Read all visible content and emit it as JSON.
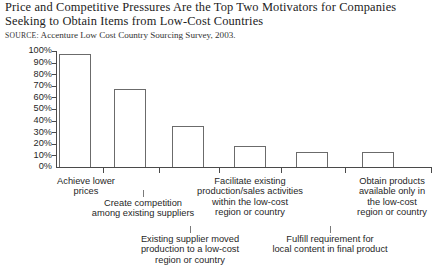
{
  "title": {
    "line1": "Price and Competitive Pressures Are the Top Two Motivators for Companies",
    "line2": "Seeking to Obtain Items from Low-Cost Countries"
  },
  "source": {
    "label": "SOURCE:",
    "text": "Accenture Low Cost Country Sourcing Survey, 2003."
  },
  "colors": {
    "axis": "#4a4a4a",
    "bar_stroke": "#6b6b6b",
    "bar_fill": "#ffffff",
    "text": "#1f1f1f",
    "page_background": "#ffffff"
  },
  "chart_data": {
    "type": "bar",
    "title": "Price and Competitive Pressures Are the Top Two Motivators for Companies Seeking to Obtain Items from Low-Cost Countries",
    "xlabel": "",
    "ylabel": "",
    "ylim": [
      0,
      100
    ],
    "grid": false,
    "legend": "none",
    "ytick_labels": [
      "100%",
      "90%",
      "80%",
      "70%",
      "60%",
      "50%",
      "40%",
      "30%",
      "20%",
      "10%",
      "0%"
    ],
    "ytick_values": [
      100,
      90,
      80,
      70,
      60,
      50,
      40,
      30,
      20,
      10,
      0
    ],
    "categories": [
      "Achieve lower prices",
      "Create competition among existing suppliers",
      "Existing supplier moved production to a low-cost region or country",
      "Facilitate existing production/sales activities within the low-cost region or country",
      "Fulfill requirement for local content in final product",
      "Obtain products available only in the low-cost region or country"
    ],
    "values": [
      97,
      67,
      35,
      18,
      13,
      13
    ],
    "category_lines": [
      [
        "Achieve lower",
        "prices"
      ],
      [
        "Create competition",
        "among existing suppliers"
      ],
      [
        "Existing supplier moved",
        "production to a low-cost",
        "region or country"
      ],
      [
        "Facilitate existing",
        "production/sales activities",
        "within the low-cost",
        "region or country"
      ],
      [
        "Fulfill requirement for",
        "local content in final product"
      ],
      [
        "Obtain products",
        "available only in",
        "the low-cost",
        "region or country"
      ]
    ]
  }
}
